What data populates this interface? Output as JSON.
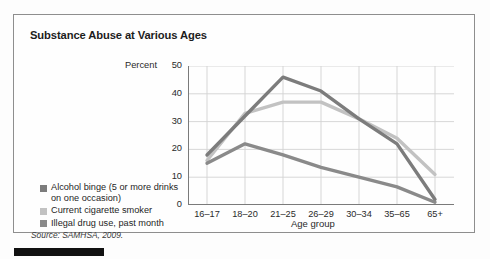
{
  "figure": {
    "title": "Substance Abuse at Various Ages",
    "source": "Source: SAMHSA, 2009."
  },
  "legend": {
    "items": [
      {
        "label": "Alcohol binge (5 or more drinks on one occasion)",
        "color": "#7c7c7c"
      },
      {
        "label": "Current cigarette smoker",
        "color": "#c2c2c2"
      },
      {
        "label": "Illegal drug use, past month",
        "color": "#8a8a8a"
      }
    ]
  },
  "chart_data": {
    "type": "line",
    "title": "Substance Abuse at Various Ages",
    "xlabel": "Age group",
    "ylabel": "Percent",
    "ylim": [
      0,
      50
    ],
    "yticks": [
      0,
      10,
      20,
      30,
      40,
      50
    ],
    "grid": true,
    "legend_position": "left-outside",
    "categories": [
      "16–17",
      "18–20",
      "21–25",
      "26–29",
      "30–34",
      "35–65",
      "65+"
    ],
    "series": [
      {
        "name": "Alcohol binge (5 or more drinks on one occasion)",
        "color": "#7c7c7c",
        "values": [
          18,
          32,
          46,
          41,
          31,
          22,
          2
        ]
      },
      {
        "name": "Current cigarette smoker",
        "color": "#c2c2c2",
        "values": [
          16,
          33,
          37,
          37,
          31,
          24,
          11
        ]
      },
      {
        "name": "Illegal drug use, past month",
        "color": "#8a8a8a",
        "values": [
          15,
          22,
          18,
          13.5,
          10,
          6.5,
          1
        ]
      }
    ]
  }
}
